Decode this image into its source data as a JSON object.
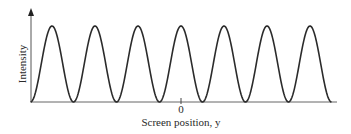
{
  "chart_data": {
    "type": "line",
    "title": "",
    "xlabel": "Screen position, y",
    "ylabel": "Intensity",
    "x_ticks": [
      {
        "position": 0,
        "label": "0"
      }
    ],
    "xlim": [
      -3.5,
      3.5
    ],
    "ylim": [
      0,
      1
    ],
    "grid": false,
    "legend": null,
    "function": "I(y) = I_max * cos^2(pi * y / period)",
    "period": 1,
    "series": [
      {
        "name": "Intensity",
        "peaks_x": [
          -3,
          -2,
          -1,
          0,
          1,
          2,
          3
        ],
        "minima_x": [
          -3.5,
          -2.5,
          -1.5,
          -0.5,
          0.5,
          1.5,
          2.5,
          3.5
        ],
        "peak_value": 1,
        "min_value": 0
      }
    ],
    "colors": {
      "curve": "#2b2b2b",
      "axis": "#555555"
    }
  },
  "labels": {
    "ylabel": "Intensity",
    "xlabel": "Screen position, y",
    "zero_tick": "0"
  }
}
